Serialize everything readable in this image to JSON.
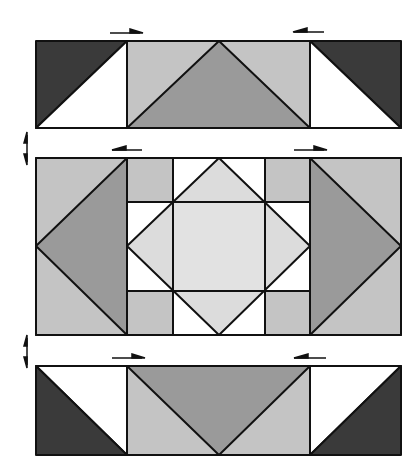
{
  "diagram": {
    "colors": {
      "dark": "#3a3a3a",
      "medium": "#9a9a9a",
      "light": "#c4c4c4",
      "lighter": "#dcdcdc",
      "white": "#ffffff",
      "stroke": "#111111"
    },
    "rows": [
      {
        "name": "top-row",
        "pressing_arrows": [
          "right",
          "left"
        ]
      },
      {
        "name": "middle-row",
        "pressing_arrows": [
          "left",
          "right"
        ]
      },
      {
        "name": "bottom-row",
        "pressing_arrows": [
          "right",
          "left"
        ]
      }
    ],
    "row_join_markers": [
      "double-arrow",
      "double-arrow"
    ]
  }
}
